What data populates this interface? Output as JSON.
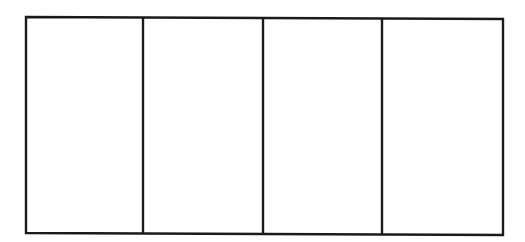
{
  "diagram": {
    "type": "partitioned-rectangle",
    "columns": 4,
    "stroke_color": "#1a1a1a",
    "background": "#ffffff",
    "outer": {
      "top_left": [
        26,
        17
      ],
      "top_right": [
        503,
        19
      ],
      "bottom_right": [
        503,
        235
      ],
      "bottom_left": [
        26,
        233
      ]
    },
    "dividers_x": [
      143,
      263,
      382
    ]
  }
}
